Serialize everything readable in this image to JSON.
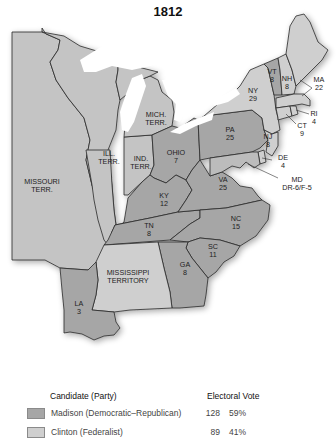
{
  "title": "1812",
  "colors": {
    "madison": "#a6a6a6",
    "clinton": "#cfcfcf",
    "territory": "#c4c4c4",
    "border": "#2a2a2a",
    "water": "#ffffff"
  },
  "states": {
    "vt": {
      "name": "VT",
      "votes": "8"
    },
    "nh": {
      "name": "NH",
      "votes": "8"
    },
    "ma": {
      "name": "MA",
      "votes": "22"
    },
    "ny": {
      "name": "NY",
      "votes": "29"
    },
    "ri": {
      "name": "RI",
      "votes": "4"
    },
    "ct": {
      "name": "CT",
      "votes": "9"
    },
    "nj": {
      "name": "NJ",
      "votes": "8"
    },
    "pa": {
      "name": "PA",
      "votes": "25"
    },
    "de": {
      "name": "DE",
      "votes": "4"
    },
    "md": {
      "name": "MD",
      "votes": "DR-6/F-5"
    },
    "va": {
      "name": "VA",
      "votes": "25"
    },
    "nc": {
      "name": "NC",
      "votes": "15"
    },
    "sc": {
      "name": "SC",
      "votes": "11"
    },
    "ga": {
      "name": "GA",
      "votes": "8"
    },
    "tn": {
      "name": "TN",
      "votes": "8"
    },
    "ky": {
      "name": "KY",
      "votes": "12"
    },
    "oh": {
      "name": "OHIO",
      "votes": "7"
    },
    "la": {
      "name": "LA",
      "votes": "3"
    }
  },
  "territories": {
    "mich": {
      "line1": "MICH.",
      "line2": "TERR."
    },
    "ill": {
      "line1": "ILL.",
      "line2": "TERR."
    },
    "ind": {
      "line1": "IND.",
      "line2": "TERR."
    },
    "missouri": {
      "line1": "MISSOURI",
      "line2": "TERR."
    },
    "mississippi": {
      "line1": "MISSISSIPPI",
      "line2": "TERRITORY"
    }
  },
  "legend": {
    "candidate_header": "Candidate (Party)",
    "vote_header": "Electoral Vote",
    "rows": [
      {
        "label": "Madison (Democratic–Republican)",
        "votes": "128",
        "percent": "59%"
      },
      {
        "label": "Clinton (Federalist)",
        "votes": "89",
        "percent": "41%"
      }
    ]
  }
}
